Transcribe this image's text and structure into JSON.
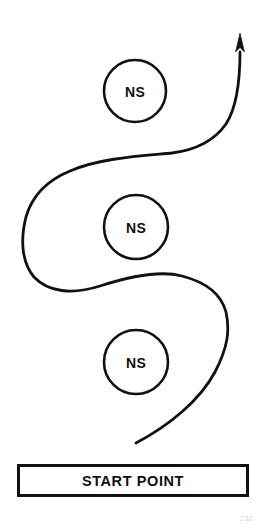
{
  "figure": {
    "type": "route-diagram",
    "background_color": "#ffffff",
    "stroke_color": "#111111",
    "width": 263,
    "height": 524
  },
  "nodes": [
    {
      "label": "NS",
      "cx": 135,
      "cy": 91,
      "r": 31
    },
    {
      "label": "NS",
      "cx": 136,
      "cy": 227,
      "r": 32
    },
    {
      "label": "NS",
      "cx": 136,
      "cy": 362,
      "r": 32
    }
  ],
  "start_box": {
    "label": "START POINT",
    "x": 17,
    "y": 464,
    "width": 232,
    "height": 33
  },
  "route": {
    "name": "slalom-route",
    "start_point": {
      "x": 136,
      "y": 443
    },
    "end_point": {
      "x": 240,
      "y": 36
    },
    "arrow_direction": "up",
    "path": "M 136 443 C 170 425 200 400 215 372 C 228 347 230 330 226 312 C 221 293 205 282 182 276 C 160 270 128 277 100 286 C 72 295 48 292 34 277 C 22 263 20 240 26 217 C 32 196 48 180 70 171 C 100 158 140 156 172 153 C 196 150 214 141 226 124 C 237 107 240 80 240 52"
  },
  "page_mark": {
    "text": "232"
  }
}
